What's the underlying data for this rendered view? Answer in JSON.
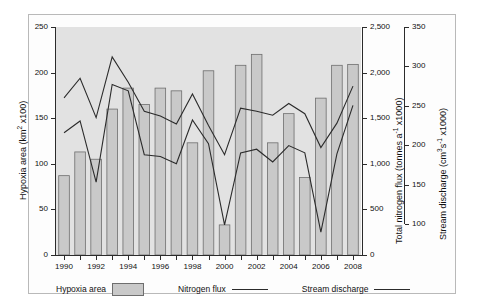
{
  "chart_data": {
    "type": "bar",
    "title": "",
    "xlabel": "",
    "categories": [
      1990,
      1991,
      1992,
      1993,
      1994,
      1995,
      1996,
      1997,
      1998,
      1999,
      2000,
      2001,
      2002,
      2003,
      2004,
      2005,
      2006,
      2007,
      2008
    ],
    "xtick_labels": [
      "1990",
      "1992",
      "1994",
      "1996",
      "1998",
      "2000",
      "2002",
      "2004",
      "2006",
      "2008"
    ],
    "xlim": [
      1989.5,
      2008.5
    ],
    "grid": false,
    "legend_position": "below-plot",
    "axes": {
      "left": {
        "label": "Hypoxia area (km² x100)",
        "ticks": [
          0,
          50,
          100,
          150,
          200,
          250
        ],
        "tick_labels": [
          "0",
          "50",
          "100",
          "150",
          "200",
          "250"
        ],
        "lim": [
          0,
          250
        ]
      },
      "right_1": {
        "label": "Total nitrogen flux (tonnes a⁻¹ x1000)",
        "ticks": [
          0,
          500,
          1000,
          1500,
          2000,
          2500
        ],
        "tick_labels": [
          "0",
          "500",
          "1,000",
          "1,500",
          "2,000",
          "2,500"
        ],
        "lim": [
          0,
          2500
        ]
      },
      "right_2": {
        "label": "Stream discharge (cm³s⁻¹ x1000)",
        "ticks": [
          100,
          150,
          200,
          250,
          300,
          350
        ],
        "tick_labels": [
          "100",
          "150",
          "200",
          "250",
          "300",
          "350"
        ],
        "lim": [
          100,
          350
        ]
      }
    },
    "series": [
      {
        "name": "Hypoxia area",
        "kind": "bar",
        "axis": "left",
        "unit": "km² x100",
        "color": "#c9c9c9",
        "edge_color": "#6e6e6e",
        "values": [
          87,
          113,
          105,
          160,
          183,
          165,
          183,
          180,
          123,
          202,
          33,
          208,
          220,
          123,
          155,
          85,
          172,
          208,
          209
        ]
      },
      {
        "name": "Nitrogen flux",
        "kind": "line",
        "axis": "right_1",
        "unit": "tonnes a⁻¹ x1000",
        "color": "#2b2b2b",
        "values": [
          1340,
          1470,
          800,
          1870,
          1800,
          1100,
          1080,
          1000,
          1480,
          1220,
          330,
          1120,
          1160,
          1020,
          1200,
          1120,
          250,
          1110,
          1640
        ]
      },
      {
        "name": "Stream discharge",
        "kind": "line",
        "axis": "right_2",
        "unit": "cm³s⁻¹ x1000",
        "color": "#2b2b2b",
        "values": [
          260,
          285,
          235,
          312,
          280,
          243,
          237,
          227,
          265,
          225,
          188,
          247,
          243,
          238,
          253,
          240,
          197,
          228,
          275
        ]
      }
    ]
  },
  "legend": {
    "items": [
      {
        "label": "Hypoxia area",
        "marker": "swatch"
      },
      {
        "label": "Nitrogen flux",
        "marker": "line"
      },
      {
        "label": "Stream discharge",
        "marker": "line"
      }
    ]
  }
}
